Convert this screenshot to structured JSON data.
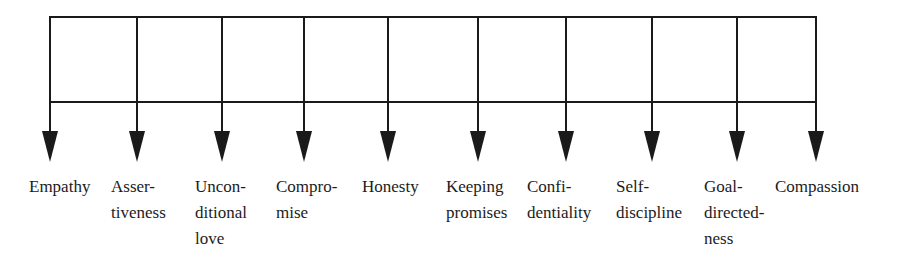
{
  "diagram": {
    "type": "tree-branching",
    "line_color": "#1a1a1a",
    "text_color": "#1c1c1c",
    "top_bar_y": 17,
    "mid_bar_y": 102,
    "arrow_head_top_y": 131,
    "arrow_tip_y": 162,
    "branches": [
      {
        "x": 50,
        "label_x": 29,
        "lines": [
          "Empathy"
        ]
      },
      {
        "x": 137,
        "label_x": 111,
        "lines": [
          "Asser-",
          "tiveness"
        ]
      },
      {
        "x": 222,
        "label_x": 195,
        "lines": [
          "Uncon-",
          "ditional",
          "love"
        ]
      },
      {
        "x": 304,
        "label_x": 276,
        "lines": [
          "Compro-",
          "mise"
        ]
      },
      {
        "x": 388,
        "label_x": 362,
        "lines": [
          "Honesty"
        ]
      },
      {
        "x": 478,
        "label_x": 446,
        "lines": [
          "Keeping",
          "promises"
        ]
      },
      {
        "x": 566,
        "label_x": 527,
        "lines": [
          "Confi-",
          "dentiality"
        ]
      },
      {
        "x": 652,
        "label_x": 616,
        "lines": [
          "Self-",
          "discipline"
        ]
      },
      {
        "x": 737,
        "label_x": 704,
        "lines": [
          "Goal-",
          "directed-",
          "ness"
        ]
      },
      {
        "x": 816,
        "label_x": 775,
        "lines": [
          "Compassion"
        ]
      }
    ]
  }
}
